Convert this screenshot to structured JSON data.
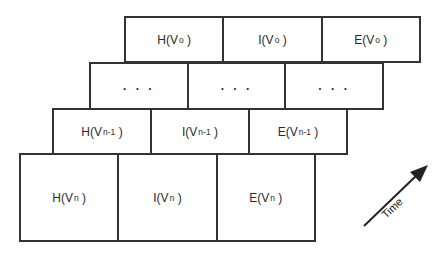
{
  "diagram": {
    "layers": [
      {
        "id": "frame-o",
        "cells": [
          {
            "func": "H",
            "var": "V",
            "sub": "o"
          },
          {
            "func": "I",
            "var": "V",
            "sub": "o"
          },
          {
            "func": "E",
            "var": "V",
            "sub": "o"
          }
        ]
      },
      {
        "id": "frame-ellipsis",
        "cells": [
          {
            "text": ". . ."
          },
          {
            "text": ". . ."
          },
          {
            "text": ". . ."
          }
        ]
      },
      {
        "id": "frame-n-1",
        "cells": [
          {
            "func": "H",
            "var": "V",
            "sub": "n-1"
          },
          {
            "func": "I",
            "var": "V",
            "sub": "n-1"
          },
          {
            "func": "E",
            "var": "V",
            "sub": "n-1"
          }
        ]
      },
      {
        "id": "frame-n",
        "cells": [
          {
            "func": "H",
            "var": "V",
            "sub": "n"
          },
          {
            "func": "I",
            "var": "V",
            "sub": "n"
          },
          {
            "func": "E",
            "var": "V",
            "sub": "n"
          }
        ]
      }
    ],
    "arrow": {
      "label": "Time",
      "direction": "up-right"
    },
    "colors": {
      "line": "#333333",
      "background": "#ffffff",
      "text": "#2a2a2a"
    }
  }
}
